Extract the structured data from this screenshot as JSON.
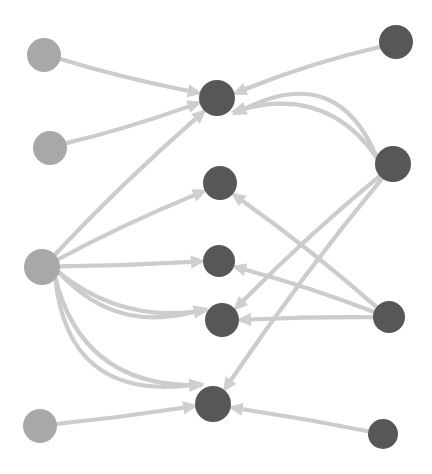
{
  "figure": {
    "kind": "directed-graph",
    "title": "",
    "width": 432,
    "height": 474,
    "background_color": "#ffffff"
  },
  "style": {
    "edge_color": "#cccccc",
    "edge_width": 4.2,
    "arrow_color": "#cfcfcf",
    "arrow_length": 15,
    "arrow_width": 13,
    "node_light_color": "#a8a8a8",
    "node_dark_color": "#575757"
  },
  "chart_data": {
    "type": "scatter",
    "title": "",
    "xlabel": "",
    "ylabel": "",
    "nodes": [
      {
        "id": "L1",
        "label": "",
        "x": 44,
        "y": 55,
        "r": 17,
        "color": "#a8a8a8",
        "group": "light"
      },
      {
        "id": "L2",
        "label": "",
        "x": 50,
        "y": 148,
        "r": 17,
        "color": "#a8a8a8",
        "group": "light"
      },
      {
        "id": "L3",
        "label": "",
        "x": 42,
        "y": 267,
        "r": 18,
        "color": "#a8a8a8",
        "group": "light"
      },
      {
        "id": "L4",
        "label": "",
        "x": 40,
        "y": 426,
        "r": 17,
        "color": "#a8a8a8",
        "group": "light"
      },
      {
        "id": "C1",
        "label": "",
        "x": 217,
        "y": 98,
        "r": 18,
        "color": "#575757",
        "group": "dark"
      },
      {
        "id": "C2",
        "label": "",
        "x": 220,
        "y": 183,
        "r": 17,
        "color": "#575757",
        "group": "dark"
      },
      {
        "id": "C3",
        "label": "",
        "x": 219,
        "y": 261,
        "r": 16,
        "color": "#575757",
        "group": "dark"
      },
      {
        "id": "C4",
        "label": "",
        "x": 222,
        "y": 320,
        "r": 17,
        "color": "#575757",
        "group": "dark"
      },
      {
        "id": "C5",
        "label": "",
        "x": 213,
        "y": 404,
        "r": 18,
        "color": "#575757",
        "group": "dark"
      },
      {
        "id": "R1",
        "label": "",
        "x": 396,
        "y": 42,
        "r": 17,
        "color": "#575757",
        "group": "dark"
      },
      {
        "id": "R2",
        "label": "",
        "x": 393,
        "y": 164,
        "r": 18,
        "color": "#575757",
        "group": "dark"
      },
      {
        "id": "R3",
        "label": "",
        "x": 389,
        "y": 317,
        "r": 16,
        "color": "#575757",
        "group": "dark"
      },
      {
        "id": "R4",
        "label": "",
        "x": 383,
        "y": 434,
        "r": 15,
        "color": "#575757",
        "group": "dark"
      }
    ],
    "edges": [
      {
        "source": "L1",
        "target": "C1",
        "curvature": 0.02
      },
      {
        "source": "L2",
        "target": "C1",
        "curvature": 0.02
      },
      {
        "source": "R1",
        "target": "C1",
        "curvature": 0.03
      },
      {
        "source": "R2",
        "target": "C1",
        "curvature": 0.26
      },
      {
        "source": "R2",
        "target": "C1",
        "curvature": 0.4
      },
      {
        "source": "L3",
        "target": "C1",
        "curvature": -0.02
      },
      {
        "source": "L3",
        "target": "C2",
        "curvature": -0.02
      },
      {
        "source": "L3",
        "target": "C3",
        "curvature": 0.01
      },
      {
        "source": "L3",
        "target": "C4",
        "curvature": 0.16
      },
      {
        "source": "L3",
        "target": "C4",
        "curvature": 0.23
      },
      {
        "source": "L3",
        "target": "C5",
        "curvature": 0.3
      },
      {
        "source": "L3",
        "target": "C5",
        "curvature": 0.4
      },
      {
        "source": "L4",
        "target": "C5",
        "curvature": 0.01
      },
      {
        "source": "R2",
        "target": "C4",
        "curvature": 0.02
      },
      {
        "source": "R2",
        "target": "C5",
        "curvature": 0.02
      },
      {
        "source": "R3",
        "target": "C2",
        "curvature": 0.02
      },
      {
        "source": "R3",
        "target": "C3",
        "curvature": 0.02
      },
      {
        "source": "R3",
        "target": "C4",
        "curvature": 0.01
      },
      {
        "source": "R4",
        "target": "C5",
        "curvature": 0.01
      }
    ],
    "legend": [],
    "grid": false,
    "node_count": 13,
    "edge_count": 19
  }
}
